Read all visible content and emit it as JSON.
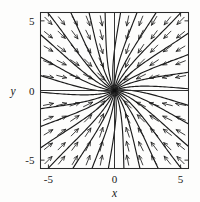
{
  "figure": {
    "kind": "phase-portrait",
    "background_color": "#fdfdfc",
    "ink_color": "#1c1c1c"
  },
  "axes": {
    "x_title": "x",
    "y_title": "y",
    "x_ticks": [
      {
        "value": -5,
        "label": "-5"
      },
      {
        "value": 0,
        "label": "0"
      },
      {
        "value": 5,
        "label": "5"
      }
    ],
    "y_ticks": [
      {
        "value": -5,
        "label": "-5"
      },
      {
        "value": 0,
        "label": "0"
      },
      {
        "value": 5,
        "label": "5"
      }
    ],
    "xlim": [
      -5.6,
      5.6
    ],
    "ylim": [
      -5.6,
      5.6
    ],
    "frame": true,
    "grid": false,
    "zero_lines": true
  },
  "chart_data": {
    "type": "scatter",
    "title": "",
    "xlabel": "x",
    "ylabel": "y",
    "xlim": [
      -5.6,
      5.6
    ],
    "ylim": [
      -5.6,
      5.6
    ],
    "grid": false,
    "legend": null,
    "equilibrium": {
      "x": 0,
      "y": 0,
      "classification": "stable node (sink)"
    },
    "field_rule": "arrows point from each sample point toward the origin",
    "trajectory_angles_deg": [
      0,
      12,
      24,
      36,
      48,
      60,
      72,
      84,
      96,
      108,
      120,
      132,
      144,
      156,
      168,
      180,
      192,
      204,
      216,
      228,
      240,
      252,
      264,
      276,
      288,
      300,
      312,
      324,
      336,
      348
    ],
    "trajectory_curvature": 0.34,
    "arrow_sample_grid": {
      "x": [
        -5,
        -4,
        -3,
        -2,
        -1,
        1,
        2,
        3,
        4,
        5
      ],
      "y": [
        -5,
        -4,
        -3,
        -2,
        -1,
        1,
        2,
        3,
        4,
        5
      ],
      "spacing": 1.0
    },
    "quadrant_flow": [
      {
        "quadrant": "upper-left",
        "arrow_direction": "right and down"
      },
      {
        "quadrant": "upper-right",
        "arrow_direction": "left and down"
      },
      {
        "quadrant": "lower-left",
        "arrow_direction": "right and up"
      },
      {
        "quadrant": "lower-right",
        "arrow_direction": "left and up"
      }
    ]
  }
}
